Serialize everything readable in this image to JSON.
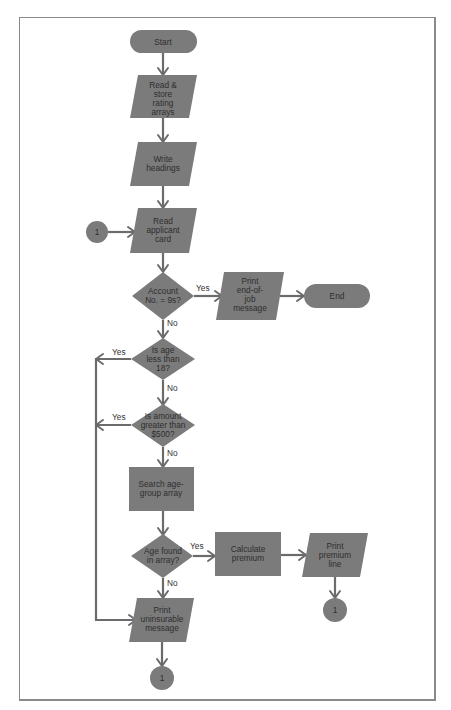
{
  "flowchart": {
    "colors": {
      "shape_fill": "#7b7b7b",
      "line": "#6b6b6b",
      "text": "#2e2e2e",
      "frame": "#8a8a8a"
    },
    "nodes": {
      "start": {
        "type": "terminal",
        "lines": [
          "Start"
        ]
      },
      "read_store": {
        "type": "io",
        "lines": [
          "Read &",
          "store",
          "rating",
          "arrays"
        ]
      },
      "write_headings": {
        "type": "io",
        "lines": [
          "Write",
          "headings"
        ]
      },
      "read_card": {
        "type": "io",
        "lines": [
          "Read",
          "applicant",
          "card"
        ]
      },
      "connector_in": {
        "type": "connector",
        "lines": [
          "1"
        ]
      },
      "account_check": {
        "type": "decision",
        "lines": [
          "Account",
          "No. = 9s?"
        ]
      },
      "print_end": {
        "type": "io",
        "lines": [
          "Print",
          "end-of-",
          "job",
          "message"
        ]
      },
      "end": {
        "type": "terminal",
        "lines": [
          "End"
        ]
      },
      "age_check": {
        "type": "decision",
        "lines": [
          "Is age",
          "less than",
          "18?"
        ]
      },
      "amount_check": {
        "type": "decision",
        "lines": [
          "Is amount",
          "greater than",
          "$500?"
        ]
      },
      "search_array": {
        "type": "process",
        "lines": [
          "Search age-",
          "group array"
        ]
      },
      "age_found": {
        "type": "decision",
        "lines": [
          "Age found",
          "in array?"
        ]
      },
      "calc_premium": {
        "type": "process",
        "lines": [
          "Calculate",
          "premium"
        ]
      },
      "print_premium": {
        "type": "io",
        "lines": [
          "Print",
          "premium",
          "line"
        ]
      },
      "connector_out_right": {
        "type": "connector",
        "lines": [
          "1"
        ]
      },
      "print_uninsurable": {
        "type": "io",
        "lines": [
          "Print",
          "uninsurable",
          "message"
        ]
      },
      "connector_out_bottom": {
        "type": "connector",
        "lines": [
          "1"
        ]
      }
    },
    "edge_labels": {
      "account_yes": "Yes",
      "account_no": "No",
      "age_yes": "Yes",
      "age_no": "No",
      "amount_yes": "Yes",
      "amount_no": "No",
      "found_yes": "Yes",
      "found_no": "No"
    }
  }
}
